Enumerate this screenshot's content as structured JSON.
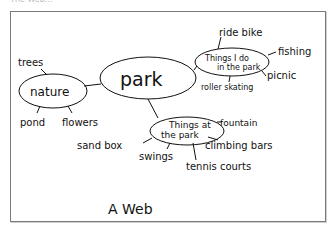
{
  "header": {
    "cutoff_text": "The Web..."
  },
  "diagram": {
    "title": "A Web",
    "center": {
      "label": "park"
    },
    "branches": [
      {
        "label": "nature",
        "children": [
          "trees",
          "pond",
          "flowers"
        ]
      },
      {
        "label_line1": "Things I do",
        "label_line2": "in the park",
        "children": [
          "ride bike",
          "fishing",
          "picnic",
          "roller skating"
        ]
      },
      {
        "label_line1": "Things at",
        "label_line2": "the park",
        "children": [
          "fountain",
          "climbing bars",
          "tennis courts",
          "swings",
          "sand box"
        ]
      }
    ],
    "colors": {
      "ink": "#111111",
      "frame": "#7a7a7a",
      "background": "#ffffff"
    }
  }
}
